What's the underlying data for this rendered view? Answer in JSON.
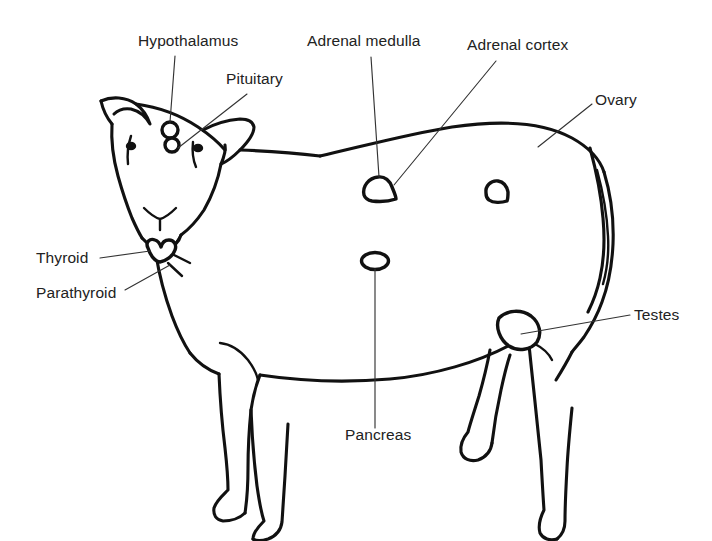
{
  "diagram": {
    "style": "line drawing",
    "colors": {
      "background": "#ffffff",
      "outline": "#111111",
      "leader": "#333333",
      "text": "#222222"
    },
    "labels": [
      {
        "id": "hypothalamus",
        "text": "Hypothalamus",
        "x": 138,
        "y": 46,
        "anchor": "start"
      },
      {
        "id": "pituitary",
        "text": "Pituitary",
        "x": 226,
        "y": 84,
        "anchor": "start"
      },
      {
        "id": "adrenal-medulla",
        "text": "Adrenal medulla",
        "x": 307,
        "y": 46,
        "anchor": "start"
      },
      {
        "id": "adrenal-cortex",
        "text": "Adrenal cortex",
        "x": 467,
        "y": 50,
        "anchor": "start"
      },
      {
        "id": "ovary",
        "text": "Ovary",
        "x": 595,
        "y": 105,
        "anchor": "start"
      },
      {
        "id": "thyroid",
        "text": "Thyroid",
        "x": 36,
        "y": 263,
        "anchor": "start"
      },
      {
        "id": "parathyroid",
        "text": "Parathyroid",
        "x": 36,
        "y": 298,
        "anchor": "start"
      },
      {
        "id": "testes",
        "text": "Testes",
        "x": 634,
        "y": 320,
        "anchor": "start"
      },
      {
        "id": "pancreas",
        "text": "Pancreas",
        "x": 345,
        "y": 440,
        "anchor": "start"
      }
    ],
    "organs": [
      {
        "id": "hypothalamus-gland",
        "shape": "circle",
        "cx": 170,
        "cy": 130,
        "r": 8
      },
      {
        "id": "pituitary-gland",
        "shape": "circle",
        "cx": 172,
        "cy": 144,
        "r": 7
      },
      {
        "id": "thyroid-gland",
        "shape": "butterfly",
        "cx": 157,
        "cy": 253
      },
      {
        "id": "adrenal-medulla-gland",
        "shape": "kidney",
        "cx": 379,
        "cy": 188
      },
      {
        "id": "adrenal-cortex-gland",
        "shape": "kidney-small",
        "cx": 497,
        "cy": 192
      },
      {
        "id": "pancreas-gland",
        "shape": "ellipse",
        "cx": 375,
        "cy": 261,
        "rx": 13,
        "ry": 8
      },
      {
        "id": "testes-gland",
        "shape": "oval",
        "cx": 517,
        "cy": 331
      }
    ]
  }
}
